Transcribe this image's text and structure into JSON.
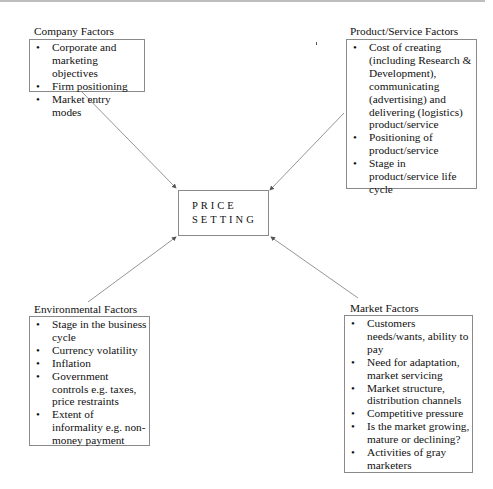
{
  "diagram": {
    "center": {
      "line1": "PRICE",
      "line2": "SETTING"
    },
    "company": {
      "title": "Company Factors",
      "items": [
        "Corporate and marketing objectives",
        "Firm positioning",
        "Market entry modes"
      ]
    },
    "product": {
      "title": "Product/Service Factors",
      "items": [
        "Cost of creating (including Research & Development), communicating (advertising) and delivering (logistics) product/service",
        "Positioning of product/service",
        "Stage in product/service life cycle"
      ]
    },
    "environmental": {
      "title": "Environmental Factors",
      "items": [
        "Stage in the business cycle",
        "Currency volatility",
        "Inflation",
        "Government controls e.g. taxes, price restraints",
        "Extent of informality e.g. non-money payment"
      ]
    },
    "market": {
      "title": "Market Factors",
      "items": [
        "Customers needs/wants, ability to pay",
        "Need for adaptation, market servicing",
        "Market structure, distribution channels",
        "Competitive pressure",
        "Is the market growing, mature or declining?",
        "Activities of gray marketers"
      ]
    },
    "bullet": "•",
    "colors": {
      "line": "#7a7a7a",
      "border": "#8a8a8a",
      "text": "#111111"
    }
  }
}
